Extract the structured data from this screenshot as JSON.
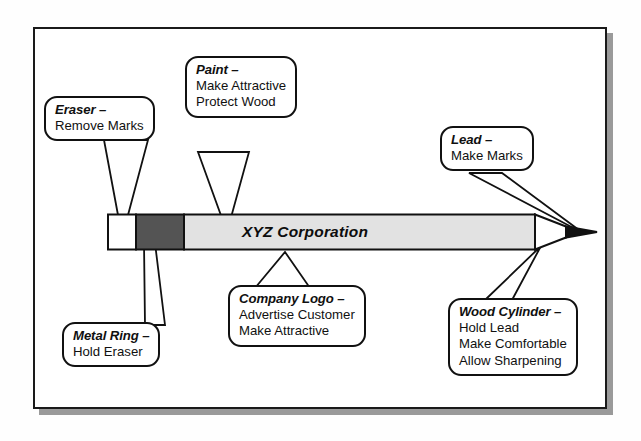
{
  "diagram": {
    "brand_text": "XYZ Corporation",
    "frame": {
      "border_color": "#1a1a1a",
      "shadow_color": "#9a9a9a",
      "fill": "#ffffff"
    },
    "colors": {
      "eraser": "#ffffff",
      "metal_ring": "#545454",
      "barrel": "#e2e2e2",
      "wood_cone": "#ffffff",
      "lead_tip": "#111111",
      "outline": "#111111",
      "text": "#101010"
    }
  },
  "callouts": [
    {
      "id": "eraser",
      "name": "Eraser",
      "head": "Eraser –",
      "lines": [
        "Remove Marks"
      ],
      "points_to": "eraser"
    },
    {
      "id": "paint",
      "name": "Paint",
      "head": "Paint –",
      "lines": [
        "Make Attractive",
        "Protect Wood"
      ],
      "points_to": "barrel"
    },
    {
      "id": "lead",
      "name": "Lead",
      "head": "Lead –",
      "lines": [
        "Make Marks"
      ],
      "points_to": "lead-tip"
    },
    {
      "id": "metal-ring",
      "name": "Metal Ring",
      "head": "Metal Ring –",
      "lines": [
        "Hold Eraser"
      ],
      "points_to": "metal-ring"
    },
    {
      "id": "company-logo",
      "name": "Company Logo",
      "head": "Company Logo –",
      "lines": [
        "Advertise Customer",
        "Make Attractive"
      ],
      "points_to": "brand-text"
    },
    {
      "id": "wood-cylinder",
      "name": "Wood Cylinder",
      "head": "Wood Cylinder –",
      "lines": [
        "Hold Lead",
        "Make Comfortable",
        "Allow Sharpening"
      ],
      "points_to": "wood-cone"
    }
  ]
}
